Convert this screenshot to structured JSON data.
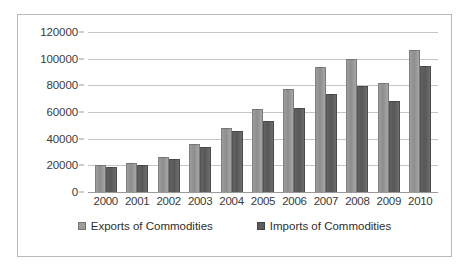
{
  "chart_data": {
    "type": "bar",
    "title": "",
    "xlabel": "",
    "ylabel": "",
    "categories": [
      "2000",
      "2001",
      "2002",
      "2003",
      "2004",
      "2005",
      "2006",
      "2007",
      "2008",
      "2009",
      "2010"
    ],
    "series": [
      {
        "name": "Exports of Commodities",
        "color": "#9d9d9d",
        "values": [
          20500,
          22000,
          26500,
          36000,
          48000,
          62000,
          77000,
          93500,
          100000,
          81500,
          106500
        ]
      },
      {
        "name": "Imports of Commodities",
        "color": "#5d5d5d",
        "values": [
          19000,
          20000,
          24500,
          33800,
          45500,
          53500,
          63000,
          73500,
          79500,
          68500,
          94500
        ]
      }
    ],
    "ylim": [
      0,
      120000
    ],
    "yticks": [
      "0",
      "20000",
      "40000",
      "60000",
      "80000",
      "100000",
      "120000"
    ],
    "ytick_values": [
      0,
      20000,
      40000,
      60000,
      80000,
      100000,
      120000
    ],
    "grid": true,
    "legend_position": "bottom"
  },
  "legend": {
    "items": [
      {
        "label": "Exports of Commodities",
        "swatch": "exports-swatch"
      },
      {
        "label": "Imports of Commodities",
        "swatch": "imports-swatch"
      }
    ]
  }
}
